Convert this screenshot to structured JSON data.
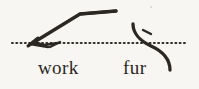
{
  "figure": {
    "kind": "shorthand-notation-plate",
    "background_color": "#f7f6f2",
    "ink_color": "#2b2723",
    "baseline": {
      "name": "dotted-writing-line",
      "style": "dotted",
      "y": 43,
      "x_start": 12,
      "x_end": 186,
      "color": "#332f2a"
    },
    "strokes": [
      {
        "id": "stroke-work",
        "label": "work",
        "description": "upward diagonal stroke bending into a horizontal stroke, with a small hook at the lower-left terminal on the writing line",
        "color": "#2b2723"
      },
      {
        "id": "stroke-fur",
        "label": "fur",
        "description": "downward curving stroke crossing the writing line, with a short detached tick mark beside its upper bend",
        "color": "#2b2723"
      }
    ],
    "marks": [
      {
        "id": "tick-fur",
        "name": "diacritic-tick",
        "description": "short slanted dash next to the fur stroke"
      },
      {
        "id": "speck",
        "name": "paper-speck",
        "description": "faint ink speck artifact near the upper right"
      }
    ]
  },
  "labels": {
    "work": "work",
    "fur": "fur"
  }
}
